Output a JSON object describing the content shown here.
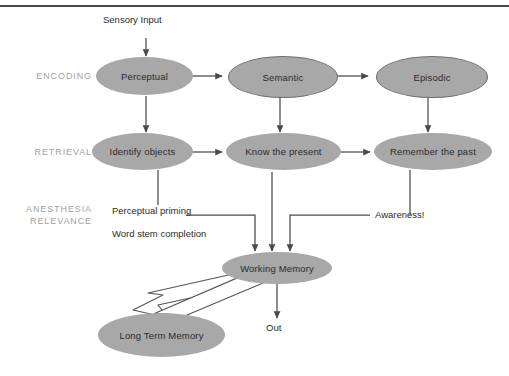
{
  "figure": {
    "top_rule_color": "#4a4a4a",
    "node_fill": "#a8a8a8",
    "node_outline": "#6d6d6d",
    "gutter_label_color": "#a0a0a0",
    "line_color": "#4a4a4a"
  },
  "gutter_labels": [
    {
      "id": "encoding",
      "text": "ENCODING"
    },
    {
      "id": "retrieval",
      "text": "RETRIEVAL"
    },
    {
      "id": "anesthesia-relevance",
      "text": "ANESTHESIA\nRELEVANCE"
    }
  ],
  "captions": [
    {
      "id": "sensory-input",
      "text": "Sensory Input"
    },
    {
      "id": "perceptual-priming",
      "text": "Perceptual priming"
    },
    {
      "id": "word-stem-completion",
      "text": "Word stem completion"
    },
    {
      "id": "awareness",
      "text": "Awareness!"
    },
    {
      "id": "out",
      "text": "Out"
    }
  ],
  "nodes": {
    "encoding_row": [
      {
        "id": "perceptual",
        "label": "Perceptual",
        "style": "plain"
      },
      {
        "id": "semantic",
        "label": "Semantic",
        "style": "outlined"
      },
      {
        "id": "episodic",
        "label": "Episodic",
        "style": "outlined"
      }
    ],
    "retrieval_row": [
      {
        "id": "identify-objects",
        "label": "Identify objects",
        "style": "plain"
      },
      {
        "id": "know-the-present",
        "label": "Know the present",
        "style": "plain"
      },
      {
        "id": "remember-the-past",
        "label": "Remember the past",
        "style": "plain"
      }
    ],
    "memory_row": [
      {
        "id": "working-memory",
        "label": "Working Memory",
        "style": "plain"
      },
      {
        "id": "long-term-memory",
        "label": "Long Term Memory",
        "style": "plain"
      }
    ]
  }
}
